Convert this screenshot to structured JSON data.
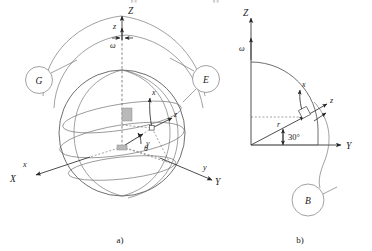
{
  "figure": {
    "type": "diagram",
    "panels": [
      {
        "id": "a",
        "caption": "a)",
        "kind": "sphere-3d",
        "axes": [
          {
            "name": "Z-axis-global",
            "label": "Z",
            "case": "upper"
          },
          {
            "name": "z-axis-local-polar",
            "label": "z",
            "case": "lower"
          },
          {
            "name": "X-axis-global",
            "label": "X",
            "case": "upper"
          },
          {
            "name": "x-axis-local",
            "label": "x",
            "case": "lower"
          },
          {
            "name": "Y-axis-global",
            "label": "Y",
            "case": "upper"
          },
          {
            "name": "y-axis-local",
            "label": "y",
            "case": "lower"
          },
          {
            "name": "z-axis-local-radial",
            "label": "z",
            "case": "lower"
          }
        ],
        "angular_velocity_label": "ω",
        "angle_label": "θ",
        "meridian_markers": [
          {
            "name": "greenwich-meridian-marker",
            "label": "G"
          },
          {
            "name": "local-meridian-marker",
            "label": "E"
          }
        ]
      },
      {
        "id": "b",
        "caption": "b)",
        "kind": "meridian-section-2d",
        "axes": [
          {
            "name": "Z-axis-global",
            "label": "Z",
            "case": "upper"
          },
          {
            "name": "Y-axis-global",
            "label": "Y",
            "case": "upper"
          },
          {
            "name": "x-axis-local-tangent",
            "label": "x",
            "case": "lower"
          },
          {
            "name": "z-axis-local-normal",
            "label": "z",
            "case": "lower"
          }
        ],
        "angular_velocity_label": "ω",
        "radius_label": "r",
        "angle_value": "30°",
        "section_marker": {
          "name": "section-plane-marker",
          "label": "B"
        }
      }
    ],
    "cut_labels": [
      "R",
      "R"
    ],
    "colors": {
      "ink": "#1a1a1a",
      "line": "#4a4a4a",
      "line_light": "#6e6e6e",
      "fill_rect": "#b9b9b9",
      "background": "#ffffff"
    }
  }
}
